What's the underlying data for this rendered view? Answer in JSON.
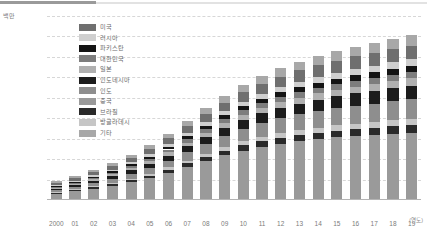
{
  "chart_data": {
    "type": "bar",
    "stacked": true,
    "title": "",
    "subtitle": "",
    "unit_label": "백만",
    "xlabel": "(연도)",
    "ylabel": "",
    "ylim": [
      0,
      9000
    ],
    "yticks": [
      0,
      1000,
      2000,
      3000,
      4000,
      5000,
      6000,
      7000,
      8000,
      9000
    ],
    "ytick_labels": [
      "0",
      "1,000",
      "2,000",
      "3,000",
      "4,000",
      "5,000",
      "6,000",
      "7,000",
      "8,000",
      "9,000"
    ],
    "grid": true,
    "legend_position": "inside-top-left",
    "categories": [
      "2000",
      "01",
      "02",
      "03",
      "04",
      "05",
      "06",
      "07",
      "08",
      "09",
      "10",
      "11",
      "12",
      "13",
      "14",
      "15",
      "16",
      "17",
      "18",
      "19"
    ],
    "series": [
      {
        "name": "중국",
        "color": "#9a9a9a",
        "values": [
          320,
          430,
          560,
          700,
          880,
          1080,
          1340,
          1620,
          1910,
          2180,
          2420,
          2610,
          2760,
          2880,
          2980,
          3060,
          3130,
          3190,
          3250,
          3300
        ]
      },
      {
        "name": "브라질",
        "color": "#2a2a2a",
        "values": [
          40,
          50,
          60,
          75,
          95,
          115,
          140,
          170,
          200,
          225,
          250,
          270,
          285,
          300,
          310,
          320,
          330,
          340,
          350,
          360
        ]
      },
      {
        "name": "방글라데시",
        "color": "#c6c6c6",
        "values": [
          30,
          38,
          48,
          60,
          75,
          92,
          112,
          135,
          158,
          180,
          200,
          218,
          232,
          245,
          256,
          266,
          275,
          284,
          292,
          300
        ]
      },
      {
        "name": "인도",
        "color": "#8e8e8e",
        "values": [
          90,
          115,
          145,
          180,
          225,
          275,
          335,
          405,
          475,
          545,
          610,
          665,
          715,
          760,
          800,
          838,
          872,
          905,
          935,
          965
        ]
      },
      {
        "name": "인도네시아",
        "color": "#1c1c1c",
        "values": [
          70,
          90,
          112,
          138,
          170,
          206,
          248,
          296,
          345,
          392,
          435,
          472,
          505,
          535,
          562,
          588,
          612,
          635,
          656,
          676
        ]
      },
      {
        "name": "일본",
        "color": "#b0b0b0",
        "values": [
          60,
          72,
          86,
          102,
          120,
          140,
          162,
          186,
          210,
          232,
          252,
          268,
          282,
          294,
          305,
          315,
          324,
          332,
          340,
          347
        ]
      },
      {
        "name": "대한민국",
        "color": "#7d7d7d",
        "values": [
          45,
          55,
          66,
          80,
          96,
          114,
          134,
          156,
          178,
          198,
          216,
          231,
          244,
          256,
          266,
          275,
          283,
          291,
          298,
          304
        ]
      },
      {
        "name": "파키스탄",
        "color": "#141414",
        "values": [
          35,
          44,
          55,
          68,
          84,
          102,
          122,
          145,
          168,
          190,
          210,
          227,
          242,
          255,
          267,
          278,
          288,
          297,
          306,
          314
        ]
      },
      {
        "name": "러시아",
        "color": "#cfcfcf",
        "values": [
          50,
          60,
          72,
          86,
          102,
          120,
          140,
          162,
          184,
          204,
          222,
          238,
          252,
          264,
          275,
          285,
          294,
          302,
          310,
          317
        ]
      },
      {
        "name": "미국",
        "color": "#6f6f6f",
        "values": [
          110,
          130,
          155,
          184,
          216,
          252,
          292,
          336,
          380,
          422,
          460,
          494,
          524,
          550,
          574,
          596,
          616,
          634,
          651,
          667
        ]
      },
      {
        "name": "기타",
        "color": "#a8a8a8",
        "values": [
          70,
          86,
          105,
          127,
          152,
          180,
          212,
          247,
          282,
          315,
          345,
          372,
          396,
          418,
          437,
          455,
          471,
          486,
          500,
          513
        ]
      }
    ],
    "legend_entries": [
      {
        "label": "미국",
        "color": "#6f6f6f"
      },
      {
        "label": "러시아",
        "color": "#cfcfcf"
      },
      {
        "label": "파키스탄",
        "color": "#141414"
      },
      {
        "label": "대한민국",
        "color": "#7d7d7d"
      },
      {
        "label": "일본",
        "color": "#b0b0b0"
      },
      {
        "label": "인도네시아",
        "color": "#1c1c1c"
      },
      {
        "label": "인도",
        "color": "#8e8e8e"
      },
      {
        "label": "중국",
        "color": "#9a9a9a"
      },
      {
        "label": "브라질",
        "color": "#2a2a2a"
      },
      {
        "label": "방글라데시",
        "color": "#c6c6c6"
      },
      {
        "label": "기타",
        "color": "#a8a8a8"
      }
    ]
  }
}
